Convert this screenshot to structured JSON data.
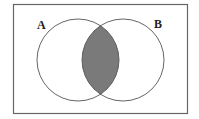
{
  "diagram": {
    "type": "venn",
    "title": "",
    "sets": [
      {
        "label": "A",
        "cx": 78,
        "cy": 60,
        "r": 41
      },
      {
        "label": "B",
        "cx": 123,
        "cy": 60,
        "r": 41
      }
    ],
    "shaded_region": "A ∩ B",
    "colors": {
      "background": "#ffffff",
      "outline": "#555555",
      "shade": "#7a7a7a",
      "universe_border": "#666666"
    },
    "universe": {
      "x": 13,
      "y": 4,
      "width": 174,
      "height": 109
    }
  },
  "labels": {
    "set_a": "A",
    "set_b": "B"
  }
}
